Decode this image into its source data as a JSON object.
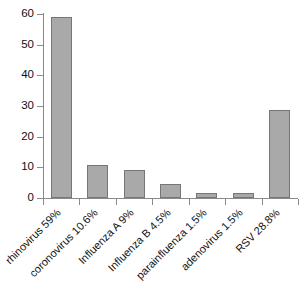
{
  "chart_data": {
    "type": "bar",
    "title": "",
    "subtitle": "",
    "xlabel": "",
    "ylabel": "",
    "ylim": [
      0,
      60
    ],
    "yticks": [
      0,
      10,
      20,
      30,
      40,
      50,
      60
    ],
    "grid": false,
    "legend": false,
    "orientation": "vertical",
    "bar_color": "#a9a9a9",
    "bar_edge_color": "#767676",
    "axis_color": "#8a8a8a",
    "background": "#ffffff",
    "label_rotation_deg": -45,
    "categories": [
      "rhinovirus 59%",
      "coronovirus 10.6%",
      "Influenza A 9%",
      "Influenza B 4.5%",
      "parainfluenza 1.5%",
      "adenovirus 1.5%",
      "RSV 28.8%"
    ],
    "values": [
      59,
      10.6,
      9,
      4.5,
      1.5,
      1.5,
      28.8
    ]
  }
}
